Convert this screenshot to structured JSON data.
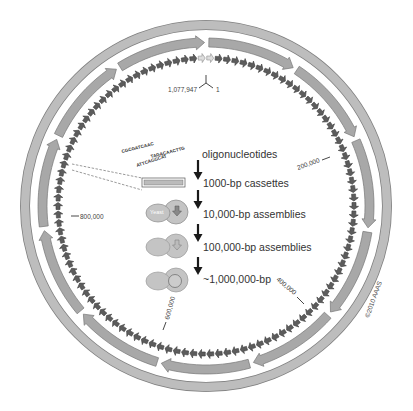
{
  "diagram": {
    "genome_markers": {
      "start_left": "1,077,947",
      "start_right": "1",
      "m200k": "200,000",
      "m400k": "400,000",
      "m600k": "600,000",
      "m800k": "800,000"
    },
    "oligos": [
      "CGCGATCAAC",
      "TAGACAACTTG",
      "ATTCAGGCAT"
    ],
    "steps": [
      {
        "label": "oligonucleotides"
      },
      {
        "label": "1000-bp cassettes"
      },
      {
        "label": "10,000-bp assemblies"
      },
      {
        "label": "100,000-bp assemblies"
      },
      {
        "label": "~1,000,000-bp"
      }
    ],
    "yeast_label": "Yeast",
    "copyright": "©2010 AAAS",
    "colors": {
      "outer_ring": "#b8b8b8",
      "middle_ring": "#a6a6a6",
      "ring_stroke": "#7a7a7a",
      "inner_segments": "#5c5c5c",
      "yeast": "#c4c4c4",
      "arrow": "#1a1a1a"
    }
  }
}
